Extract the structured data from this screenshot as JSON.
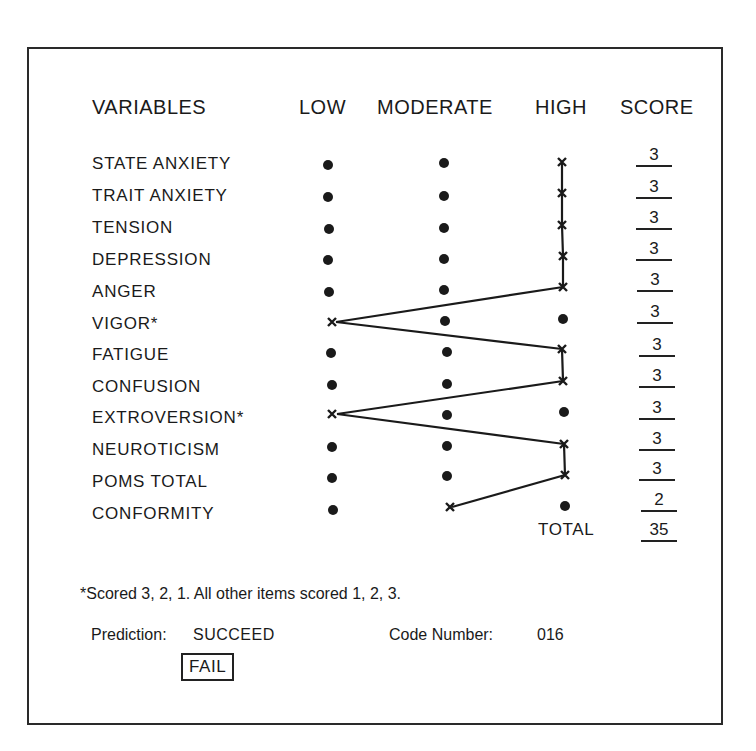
{
  "headers": {
    "variables": "VARIABLES",
    "low": "LOW",
    "moderate": "MODERATE",
    "high": "HIGH",
    "score": "SCORE"
  },
  "rows": [
    {
      "label": "STATE ANXIETY",
      "marked": "high",
      "score": "3"
    },
    {
      "label": "TRAIT ANXIETY",
      "marked": "high",
      "score": "3"
    },
    {
      "label": "TENSION",
      "marked": "high",
      "score": "3"
    },
    {
      "label": "DEPRESSION",
      "marked": "high",
      "score": "3"
    },
    {
      "label": "ANGER",
      "marked": "high",
      "score": "3"
    },
    {
      "label": "VIGOR*",
      "marked": "low",
      "score": "3"
    },
    {
      "label": "FATIGUE",
      "marked": "high",
      "score": "3"
    },
    {
      "label": "CONFUSION",
      "marked": "high",
      "score": "3"
    },
    {
      "label": "EXTROVERSION*",
      "marked": "low",
      "score": "3"
    },
    {
      "label": "NEUROTICISM",
      "marked": "high",
      "score": "3"
    },
    {
      "label": "POMS TOTAL",
      "marked": "high",
      "score": "3"
    },
    {
      "label": "CONFORMITY",
      "marked": "moderate",
      "score": "2"
    }
  ],
  "total": {
    "label": "TOTAL",
    "value": "35"
  },
  "footnote": "*Scored 3, 2, 1.  All other items scored 1, 2, 3.",
  "prediction": {
    "label": "Prediction:",
    "option_succeed": "SUCCEED",
    "option_fail": "FAIL",
    "selected": "FAIL"
  },
  "code": {
    "label": "Code Number:",
    "value": "016"
  },
  "colors": {
    "ink": "#1a1a1a",
    "paper": "#ffffff"
  }
}
